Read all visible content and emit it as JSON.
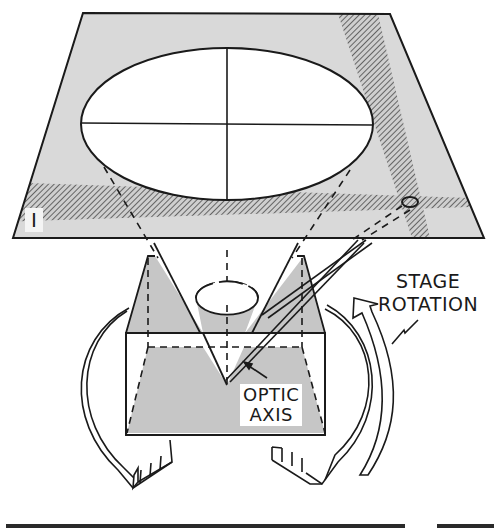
{
  "figure": {
    "plate_label": "I",
    "labels": {
      "stage_rotation_line1": "STAGE",
      "stage_rotation_line2": "ROTATION",
      "optic_axis_line1": "OPTIC",
      "optic_axis_line2": "AXIS"
    },
    "colors": {
      "background": "#ffffff",
      "plate_fill": "#d9d9d9",
      "crystal_shade": "#c6c6c6",
      "line": "#1a1a1a",
      "hatch": "#555555"
    },
    "components": [
      "interference-figure-plate",
      "indicatrix-ellipse",
      "crosshair",
      "isogyre-band-horizontal",
      "isogyre-band-vertical",
      "melatope-marker",
      "crystal-block",
      "optic-axis-double-line",
      "stage-rotation-arrows"
    ]
  }
}
